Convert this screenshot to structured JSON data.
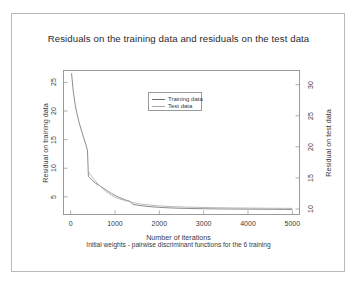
{
  "figure": {
    "title": "Residuals on the training data and residuals on the test data"
  },
  "chart_data": {
    "type": "line",
    "title": "Residuals on the training data and residuals on the test data",
    "xlabel": "Number of iterations",
    "subtitle": "Initial weights - pairwise discriminant functions for the 6 training",
    "ylabel_left": "Residual on training data",
    "ylabel_right": "Residual on test data",
    "xlim": [
      -150,
      5150
    ],
    "ylim_left": [
      2.0,
      27.0
    ],
    "ylim_right": [
      9.2,
      32.2
    ],
    "xticks": [
      0,
      1000,
      2000,
      3000,
      4000,
      5000
    ],
    "yticks_left": [
      5,
      10,
      15,
      20,
      25
    ],
    "yticks_right": [
      10,
      15,
      20,
      25,
      30
    ],
    "grid": false,
    "legend_position": "upper-center",
    "series": [
      {
        "name": "Training data",
        "axis": "left",
        "color": "#6e6e6e",
        "x": [
          20,
          60,
          100,
          140,
          180,
          220,
          260,
          300,
          340,
          380,
          400,
          420,
          460,
          500,
          560,
          620,
          680,
          740,
          800,
          860,
          920,
          980,
          1040,
          1100,
          1160,
          1220,
          1280,
          1340,
          1400,
          1500,
          1600,
          1700,
          1800,
          1900,
          2000,
          2200,
          2400,
          2600,
          2800,
          3000,
          3200,
          3400,
          3600,
          3800,
          4000,
          4200,
          4400,
          4600,
          4800,
          5000
        ],
        "y": [
          26.6,
          23.4,
          21.2,
          19.6,
          18.3,
          17.2,
          16.2,
          15.2,
          14.2,
          13.1,
          8.6,
          8.4,
          8.1,
          7.8,
          7.4,
          7.1,
          6.8,
          6.5,
          6.2,
          5.9,
          5.6,
          5.35,
          5.1,
          4.9,
          4.7,
          4.5,
          4.35,
          4.2,
          3.7,
          3.55,
          3.45,
          3.35,
          3.28,
          3.22,
          3.16,
          3.08,
          3.02,
          2.98,
          2.95,
          2.92,
          2.9,
          2.88,
          2.87,
          2.86,
          2.85,
          2.84,
          2.83,
          2.82,
          2.81,
          2.8
        ]
      },
      {
        "name": "Test data",
        "axis": "right",
        "color": "#a8a8a8",
        "x": [
          400,
          440,
          500,
          560,
          620,
          680,
          740,
          800,
          860,
          920,
          980,
          1040,
          1100,
          1160,
          1220,
          1280,
          1340,
          1400,
          1500,
          1600,
          1700,
          1800,
          1900,
          2000,
          2200,
          2400,
          2600,
          2800,
          3000,
          3200,
          3400,
          3600,
          3800,
          4000,
          4200,
          4400,
          4600,
          4800,
          5000
        ],
        "y": [
          16.0,
          15.6,
          15.0,
          14.5,
          14.0,
          13.6,
          13.2,
          12.8,
          12.5,
          12.2,
          12.0,
          11.8,
          11.65,
          11.5,
          11.38,
          11.28,
          11.18,
          11.05,
          10.9,
          10.78,
          10.7,
          10.62,
          10.56,
          10.5,
          10.42,
          10.36,
          10.32,
          10.28,
          10.25,
          10.22,
          10.2,
          10.18,
          10.16,
          10.15,
          10.14,
          10.13,
          10.12,
          10.11,
          10.1
        ]
      }
    ],
    "legend": [
      {
        "label": "Training data",
        "color": "#6e6e6e"
      },
      {
        "label": "Test data",
        "color": "#a8a8a8"
      }
    ]
  }
}
